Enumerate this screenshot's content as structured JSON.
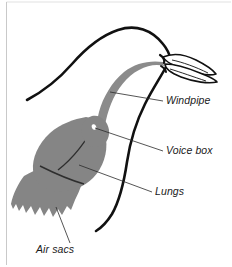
{
  "figure": {
    "background_color": "#ffffff",
    "frame_color": "#c9c9c9"
  },
  "colors": {
    "organ_fill": "#858585",
    "organ_fill_dark": "#6f6f6f",
    "outline": "#111111",
    "beak_fill": "#ffffff",
    "label_text": "#1a1a1a",
    "leader_line": "#2a2a2a"
  },
  "labels": [
    {
      "id": "windpipe",
      "text": "Windpipe",
      "x": 166,
      "y": 104,
      "anchor": "start"
    },
    {
      "id": "voice-box",
      "text": "Voice box",
      "x": 166,
      "y": 154,
      "anchor": "start"
    },
    {
      "id": "lungs",
      "text": "Lungs",
      "x": 155,
      "y": 195,
      "anchor": "start"
    },
    {
      "id": "air-sacs",
      "text": "Air sacs",
      "x": 36,
      "y": 253,
      "anchor": "start"
    }
  ],
  "leader_lines": [
    {
      "id": "windpipe-leader",
      "d": "M 110 92 L 163 101"
    },
    {
      "id": "voice-box-leader",
      "d": "M 95 128 L 163 151"
    },
    {
      "id": "lungs-leader",
      "d": "M 79 165 L 152 192"
    },
    {
      "id": "air-sacs-leader",
      "d": "M 56 207 L 70 243"
    }
  ],
  "anatomy": {
    "neck_outline": {
      "id": "neck-back-outline",
      "description": "black curved back-of-neck outline from lower left up over the head"
    },
    "body_outline": {
      "id": "body-front-outline",
      "description": "black curved breast outline from beak down to lower body"
    },
    "windpipe": {
      "id": "trachea-tube",
      "description": "gray tube running through the neck from the beak to the voice box"
    },
    "voice_box": {
      "id": "syrinx",
      "description": "gray bulge at base of windpipe with white highlight"
    },
    "lungs": {
      "id": "lungs-mass",
      "description": "large gray rounded mass with internal dividing curves"
    },
    "air_sacs": {
      "id": "air-sacs-mass",
      "description": "gray lobed mass with jagged lower edge below the lungs"
    },
    "beak": {
      "id": "beak",
      "description": "white pointed beak with black outline and internal lines"
    }
  }
}
